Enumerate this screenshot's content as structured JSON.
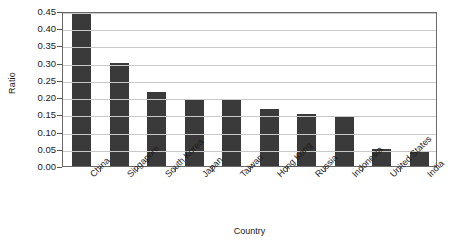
{
  "chart_data": {
    "type": "bar",
    "title": "",
    "xlabel": "Country",
    "ylabel": "Ratio",
    "categories": [
      "China",
      "Singapore",
      "South Korea",
      "Japan",
      "Taiwan",
      "Hong Kong",
      "Russia",
      "Indonesia",
      "United States",
      "India"
    ],
    "values": [
      0.44,
      0.3,
      0.215,
      0.195,
      0.195,
      0.165,
      0.15,
      0.145,
      0.05,
      0.045
    ],
    "ylim": [
      0.0,
      0.45
    ],
    "ytick_values": [
      0.0,
      0.05,
      0.1,
      0.15,
      0.2,
      0.25,
      0.3,
      0.35,
      0.4,
      0.45
    ],
    "ytick_labels": [
      "0.00",
      "0.05",
      "0.10",
      "0.15",
      "0.20",
      "0.25",
      "0.30",
      "0.35",
      "0.40",
      "0.45"
    ],
    "grid": "horizontal",
    "legend": "none",
    "bar_color": "#3a3a3a",
    "gridline_color": "#c8c8c8",
    "frame_color": "#6a6a6a",
    "background_color": "#ffffff",
    "xtick_label_rotation": 45
  }
}
